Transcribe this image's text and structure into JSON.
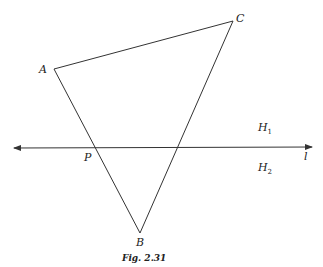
{
  "figure": {
    "caption": "Fig. 2.31",
    "points": {
      "A": {
        "label": "A",
        "x": 54,
        "y": 69
      },
      "B": {
        "label": "B",
        "x": 140,
        "y": 233
      },
      "C": {
        "label": "C",
        "x": 233,
        "y": 21
      },
      "P": {
        "label": "P",
        "x": 95,
        "y": 148
      }
    },
    "line": {
      "label": "l",
      "y": 148,
      "x1": 12,
      "x2": 313
    },
    "half_planes": {
      "upper": {
        "label": "H",
        "sub": "1"
      },
      "lower": {
        "label": "H",
        "sub": "2"
      }
    },
    "stroke_color": "#333333"
  }
}
